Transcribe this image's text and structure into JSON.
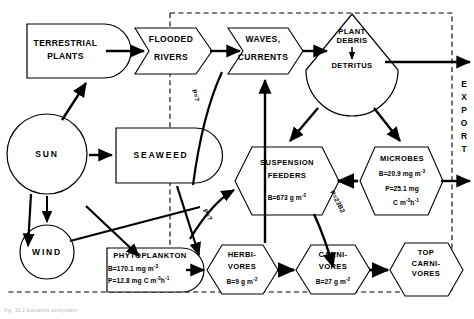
{
  "diagram": {
    "boundary_label": "EXPORT",
    "caption": "Fig. 10.2  Estuarine ecosystem",
    "line_color": "#000000",
    "background": "#ffffff",
    "dashed_boundary_color": "#000000"
  },
  "nodes": {
    "terrestrial_plants": {
      "name": "terrestrial-plants",
      "line1": "TERRESTRIAL",
      "line2": "PLANTS",
      "shape": "producer-bullet"
    },
    "flooded_rivers": {
      "name": "flooded-rivers",
      "line1": "FLOODED",
      "line2": "RIVERS",
      "shape": "interaction-arrow"
    },
    "waves_currents": {
      "name": "waves-currents",
      "line1": "WAVES,",
      "line2": "CURRENTS",
      "shape": "interaction-arrow"
    },
    "plant_debris": {
      "name": "plant-debris-detritus",
      "line1": "PLANT",
      "line2": "DEBRIS",
      "line3": "DETRITUS",
      "shape": "storage-tank"
    },
    "sun": {
      "name": "sun",
      "label": "SUN",
      "shape": "circle-source"
    },
    "wind": {
      "name": "wind",
      "label": "WIND",
      "shape": "circle-source"
    },
    "seaweed": {
      "name": "seaweed",
      "label": "SEAWEED",
      "shape": "producer-bullet"
    },
    "phytoplankton": {
      "name": "phytoplankton",
      "label": "PHYTOPLANKTON",
      "biomass": "B=170.1 mg m",
      "biomass_exp": "-3",
      "production_a": "P=12.8 mg C m",
      "production_exp_a": "-3",
      "production_b": "h",
      "production_exp_b": "-1",
      "shape": "producer-bullet"
    },
    "suspension_feeders": {
      "name": "suspension-feeders",
      "line1": "SUSPENSION",
      "line2": "FEEDERS",
      "biomass": "B=673 g m",
      "biomass_exp": "-2",
      "shape": "consumer-hexagon"
    },
    "microbes": {
      "name": "microbes",
      "label": "MICROBES",
      "biomass": "B=20.9 mg m",
      "biomass_exp": "-3",
      "production_a": "P=25.1 mg",
      "production_b": "C m",
      "production_exp_b": "-3",
      "production_c": "h",
      "production_exp_c": "-1",
      "shape": "consumer-hexagon"
    },
    "herbivores": {
      "name": "herbivores",
      "line1": "HERBI-",
      "line2": "VORES",
      "biomass": "B=9 g m",
      "biomass_exp": "-2",
      "shape": "consumer-hexagon"
    },
    "carnivores": {
      "name": "carnivores",
      "line1": "CARNI-",
      "line2": "VORES",
      "biomass": "B=27 g m",
      "biomass_exp": "-2",
      "shape": "consumer-hexagon"
    },
    "top_carnivores": {
      "name": "top-carnivores",
      "line1": "TOP",
      "line2": "CARNI-",
      "line3": "VORES",
      "shape": "consumer-hexagon"
    }
  },
  "flow_labels": {
    "rivers_to_waves": "P=?",
    "seaweed_to_suspension": "P=?",
    "suspension_to_carnivores": "P=23B2"
  }
}
